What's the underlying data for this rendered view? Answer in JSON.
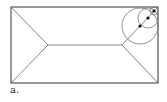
{
  "figure": {
    "caption": "a.",
    "rectangle": {
      "x": 11,
      "y": 7,
      "width": 147,
      "height": 76
    },
    "skeleton": {
      "left_vertex": [
        48,
        45
      ],
      "right_vertex": [
        122,
        45
      ]
    },
    "circles": [
      {
        "cx": 140,
        "cy": 26,
        "r": 18
      },
      {
        "cx": 148,
        "cy": 18,
        "r": 10
      },
      {
        "cx": 154,
        "cy": 11,
        "r": 4
      }
    ],
    "points": [
      [
        140,
        26
      ],
      [
        148,
        18
      ],
      [
        154,
        11
      ]
    ],
    "stroke_color": "#555555"
  }
}
